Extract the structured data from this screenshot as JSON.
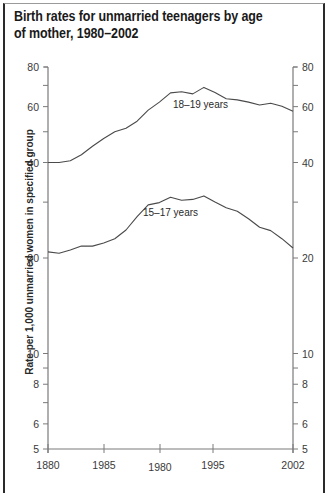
{
  "chart_data": {
    "type": "line",
    "title": "Birth rates for unmarried teenagers by age of mother, 1980–2002",
    "xlabel": "",
    "ylabel": "Rate per 1,000 unmarried women in specified group",
    "yscale": "log",
    "ylim": [
      5,
      80
    ],
    "grid": false,
    "legend_position": "inline labels",
    "y_ticks_major": [
      80,
      60,
      40,
      20,
      10,
      8,
      6,
      5
    ],
    "y_ticks_minor": [
      70,
      50,
      30,
      9,
      7
    ],
    "x_tick_labels": [
      "1880",
      "1985",
      "1980",
      "1995",
      "2002"
    ],
    "x": [
      1980,
      1981,
      1982,
      1983,
      1984,
      1985,
      1986,
      1987,
      1988,
      1989,
      1990,
      1991,
      1992,
      1993,
      1994,
      1995,
      1996,
      1997,
      1998,
      1999,
      2000,
      2001,
      2002
    ],
    "series": [
      {
        "name": "18–19 years",
        "values": [
          40,
          40,
          40.5,
          42.3,
          45.0,
          47.6,
          50.0,
          51.3,
          54.0,
          58.5,
          62.0,
          66.3,
          66.8,
          65.8,
          69.0,
          66.5,
          63.5,
          63.0,
          62.0,
          60.7,
          61.5,
          60.2,
          58.0
        ]
      },
      {
        "name": "15–17 years",
        "values": [
          20.9,
          20.7,
          21.2,
          21.8,
          21.8,
          22.3,
          23.0,
          24.5,
          27.0,
          29.4,
          29.9,
          31.1,
          30.4,
          30.6,
          31.4,
          30.0,
          28.8,
          28.1,
          26.6,
          25.0,
          24.4,
          23.0,
          21.5
        ]
      }
    ],
    "annotations": [
      {
        "text": "18–19 years",
        "near_x": 1992,
        "near_y": 60
      },
      {
        "text": "15–17 years",
        "near_x": 1992,
        "near_y": 28
      }
    ]
  },
  "header": {
    "title": "Birth rates for unmarried teenagers by age of mother, 1980–2002"
  },
  "axes": {
    "y_left_labels": [
      "80",
      "60",
      "40",
      "20",
      "10",
      "8",
      "6",
      "5"
    ],
    "y_right_labels": [
      "80",
      "60",
      "40",
      "20",
      "10",
      "8",
      "6",
      "5"
    ],
    "y_axis_title": "Rate per 1,000 unmarried women in specified group",
    "x_labels": [
      "1880",
      "1985",
      "1980",
      "1995",
      "2002"
    ]
  },
  "labels": {
    "series_1": "18–19 years",
    "series_2": "15–17 years"
  },
  "colors": {
    "line": "#4a4a4a",
    "axis": "#7a7a7a",
    "text": "#2a2a2a",
    "frame": "#2a2a2a"
  }
}
